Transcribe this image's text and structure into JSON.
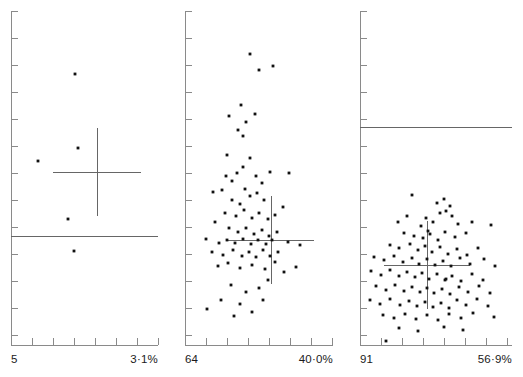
{
  "figure": {
    "type": "multi-panel-scatter",
    "width": 523,
    "height": 377,
    "background": "#ffffff",
    "marker_color": "#111111",
    "axis_color": "#8a8a8a",
    "line_color": "#666666"
  },
  "panels": [
    {
      "id": "panel-1",
      "x_origin": 11,
      "x_end": 158,
      "y_top": 11,
      "y_bottom": 345,
      "left_label": "5",
      "right_label": "3·1%",
      "x_ticks": [
        32,
        53,
        74,
        95,
        116,
        137,
        158
      ],
      "y_ticks": [
        11,
        38,
        65,
        92,
        119,
        146,
        173,
        200,
        227,
        254,
        281,
        308,
        335,
        345
      ],
      "reference_line": {
        "y": 236,
        "x1": 11,
        "x2": 158
      },
      "crosshair": {
        "cx": 97,
        "cy": 172,
        "x1": 53,
        "x2": 141,
        "y1": 128,
        "y2": 216
      },
      "points": [
        [
          75,
          74
        ],
        [
          78,
          148
        ],
        [
          38,
          161
        ],
        [
          68,
          219
        ],
        [
          74,
          251
        ]
      ]
    },
    {
      "id": "panel-2",
      "x_origin": 185,
      "x_end": 333,
      "y_top": 11,
      "y_bottom": 345,
      "left_label": "64",
      "right_label": "40·0%",
      "x_ticks": [
        206,
        227,
        248,
        269,
        290,
        311,
        332
      ],
      "y_ticks": [
        11,
        38,
        65,
        92,
        119,
        146,
        173,
        200,
        227,
        254,
        281,
        308,
        335,
        345
      ],
      "reference_line": null,
      "crosshair": {
        "cx": 271,
        "cy": 240,
        "x1": 228,
        "x2": 314,
        "y1": 196,
        "y2": 284
      },
      "points": [
        [
          250,
          54
        ],
        [
          259,
          70
        ],
        [
          273,
          66
        ],
        [
          241,
          105
        ],
        [
          255,
          114
        ],
        [
          229,
          116
        ],
        [
          238,
          130
        ],
        [
          243,
          136
        ],
        [
          246,
          122
        ],
        [
          227,
          155
        ],
        [
          250,
          158
        ],
        [
          243,
          167
        ],
        [
          237,
          173
        ],
        [
          226,
          176
        ],
        [
          232,
          181
        ],
        [
          256,
          176
        ],
        [
          262,
          183
        ],
        [
          270,
          172
        ],
        [
          289,
          173
        ],
        [
          213,
          192
        ],
        [
          222,
          190
        ],
        [
          245,
          189
        ],
        [
          250,
          196
        ],
        [
          257,
          193
        ],
        [
          240,
          204
        ],
        [
          232,
          200
        ],
        [
          264,
          200
        ],
        [
          225,
          213
        ],
        [
          236,
          216
        ],
        [
          244,
          210
        ],
        [
          252,
          218
        ],
        [
          259,
          213
        ],
        [
          268,
          219
        ],
        [
          275,
          215
        ],
        [
          283,
          207
        ],
        [
          215,
          222
        ],
        [
          229,
          228
        ],
        [
          238,
          232
        ],
        [
          246,
          228
        ],
        [
          254,
          234
        ],
        [
          262,
          230
        ],
        [
          269,
          236
        ],
        [
          277,
          232
        ],
        [
          206,
          239
        ],
        [
          219,
          243
        ],
        [
          227,
          240
        ],
        [
          235,
          243
        ],
        [
          243,
          239
        ],
        [
          251,
          244
        ],
        [
          258,
          240
        ],
        [
          266,
          244
        ],
        [
          272,
          240
        ],
        [
          288,
          242
        ],
        [
          300,
          245
        ],
        [
          212,
          252
        ],
        [
          223,
          255
        ],
        [
          233,
          250
        ],
        [
          242,
          256
        ],
        [
          249,
          252
        ],
        [
          256,
          257
        ],
        [
          263,
          250
        ],
        [
          270,
          256
        ],
        [
          278,
          252
        ],
        [
          218,
          266
        ],
        [
          228,
          263
        ],
        [
          240,
          268
        ],
        [
          252,
          265
        ],
        [
          265,
          269
        ],
        [
          275,
          262
        ],
        [
          231,
          285
        ],
        [
          246,
          292
        ],
        [
          259,
          288
        ],
        [
          268,
          280
        ],
        [
          284,
          272
        ],
        [
          296,
          267
        ],
        [
          221,
          300
        ],
        [
          240,
          304
        ],
        [
          263,
          300
        ],
        [
          207,
          309
        ],
        [
          234,
          316
        ],
        [
          252,
          312
        ]
      ]
    },
    {
      "id": "panel-3",
      "x_origin": 360,
      "x_end": 512,
      "y_top": 11,
      "y_bottom": 345,
      "left_label": "91",
      "right_label": "56·9%",
      "x_ticks": [
        381,
        402,
        423,
        444,
        465,
        486,
        507
      ],
      "y_ticks": [
        11,
        38,
        65,
        92,
        119,
        146,
        173,
        200,
        227,
        254,
        281,
        308,
        335,
        345
      ],
      "reference_line": {
        "y": 127,
        "x1": 360,
        "x2": 512
      },
      "crosshair": {
        "cx": 427,
        "cy": 265,
        "x1": 384,
        "x2": 470,
        "y1": 221,
        "y2": 309
      },
      "points": [
        [
          386,
          341
        ],
        [
          412,
          195
        ],
        [
          437,
          203
        ],
        [
          444,
          199
        ],
        [
          450,
          206
        ],
        [
          440,
          213
        ],
        [
          446,
          211
        ],
        [
          452,
          216
        ],
        [
          398,
          222
        ],
        [
          407,
          216
        ],
        [
          426,
          218
        ],
        [
          433,
          222
        ],
        [
          421,
          226
        ],
        [
          428,
          231
        ],
        [
          458,
          224
        ],
        [
          472,
          222
        ],
        [
          491,
          225
        ],
        [
          404,
          233
        ],
        [
          414,
          236
        ],
        [
          423,
          238
        ],
        [
          430,
          234
        ],
        [
          438,
          240
        ],
        [
          445,
          232
        ],
        [
          455,
          237
        ],
        [
          466,
          233
        ],
        [
          390,
          245
        ],
        [
          399,
          248
        ],
        [
          410,
          244
        ],
        [
          418,
          250
        ],
        [
          425,
          246
        ],
        [
          432,
          252
        ],
        [
          440,
          247
        ],
        [
          448,
          254
        ],
        [
          457,
          249
        ],
        [
          467,
          255
        ],
        [
          478,
          248
        ],
        [
          374,
          257
        ],
        [
          384,
          260
        ],
        [
          394,
          256
        ],
        [
          403,
          262
        ],
        [
          412,
          258
        ],
        [
          419,
          264
        ],
        [
          427,
          259
        ],
        [
          435,
          265
        ],
        [
          443,
          261
        ],
        [
          451,
          266
        ],
        [
          460,
          258
        ],
        [
          470,
          264
        ],
        [
          484,
          259
        ],
        [
          495,
          266
        ],
        [
          371,
          271
        ],
        [
          381,
          275
        ],
        [
          390,
          270
        ],
        [
          399,
          276
        ],
        [
          407,
          272
        ],
        [
          415,
          277
        ],
        [
          422,
          273
        ],
        [
          429,
          279
        ],
        [
          437,
          274
        ],
        [
          445,
          280
        ],
        [
          446,
          279
        ],
        [
          452,
          276
        ],
        [
          461,
          281
        ],
        [
          472,
          274
        ],
        [
          483,
          280
        ],
        [
          376,
          286
        ],
        [
          386,
          290
        ],
        [
          395,
          285
        ],
        [
          404,
          291
        ],
        [
          412,
          287
        ],
        [
          420,
          292
        ],
        [
          427,
          288
        ],
        [
          434,
          293
        ],
        [
          442,
          289
        ],
        [
          450,
          294
        ],
        [
          459,
          287
        ],
        [
          468,
          292
        ],
        [
          479,
          286
        ],
        [
          490,
          293
        ],
        [
          370,
          300
        ],
        [
          380,
          304
        ],
        [
          390,
          299
        ],
        [
          400,
          305
        ],
        [
          409,
          301
        ],
        [
          417,
          306
        ],
        [
          425,
          302
        ],
        [
          433,
          307
        ],
        [
          441,
          303
        ],
        [
          449,
          308
        ],
        [
          457,
          300
        ],
        [
          466,
          305
        ],
        [
          477,
          299
        ],
        [
          488,
          306
        ],
        [
          383,
          315
        ],
        [
          394,
          318
        ],
        [
          405,
          314
        ],
        [
          416,
          319
        ],
        [
          427,
          315
        ],
        [
          438,
          320
        ],
        [
          449,
          314
        ],
        [
          461,
          318
        ],
        [
          473,
          313
        ],
        [
          494,
          317
        ],
        [
          399,
          328
        ],
        [
          418,
          331
        ],
        [
          444,
          327
        ],
        [
          463,
          330
        ]
      ]
    }
  ]
}
